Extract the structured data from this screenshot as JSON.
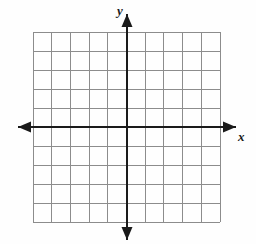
{
  "figure": {
    "kind": "blank-cartesian-coordinate-grid",
    "background_color": "#fefefe",
    "grid": {
      "color": "#8c8c8c",
      "line_width": 1,
      "cell_size_px": 18.7,
      "columns": 10,
      "rows": 10,
      "vertical_line_count": 11,
      "horizontal_line_count": 11,
      "left_px": 33,
      "right_px": 220,
      "top_px": 32,
      "bottom_px": 222
    },
    "axes": {
      "color": "#1a1a1a",
      "line_width": 2.4,
      "origin_px": {
        "x": 127,
        "y": 127
      },
      "x_axis": {
        "label": "x",
        "label_style": "italic-bold",
        "start_px": 18,
        "end_px": 236,
        "arrowheads": [
          "left",
          "right"
        ],
        "tick_labels": [],
        "visible_units_left": 5,
        "visible_units_right": 5
      },
      "y_axis": {
        "label": "y",
        "label_style": "italic-bold",
        "start_px": 14,
        "end_px": 240,
        "arrowheads": [
          "up",
          "down"
        ],
        "tick_labels": [],
        "visible_units_up": 5,
        "visible_units_down": 5
      }
    },
    "plotted_data": {
      "points": [],
      "lines": [],
      "curves": [],
      "labels": []
    }
  }
}
